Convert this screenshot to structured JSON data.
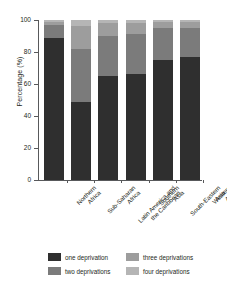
{
  "chart_data": {
    "type": "bar",
    "stacked": true,
    "title": "",
    "xlabel": "",
    "ylabel": "Percentage (%)",
    "ylim": [
      0,
      100
    ],
    "yticks": [
      0,
      20,
      40,
      60,
      80,
      100
    ],
    "grid": false,
    "legend_position": "bottom",
    "categories": [
      "Northern Africa",
      "Sub-Saharan Africa",
      "Latin America and the Caribbean",
      "Southern Asia",
      "South-Eastern Asia",
      "Western Asia"
    ],
    "category_lines": [
      [
        "Northern",
        "Africa"
      ],
      [
        "Sub-Saharan",
        "Africa"
      ],
      [
        "Latin America and",
        "the Caribbean"
      ],
      [
        "Southern",
        "Asia"
      ],
      [
        "South-Eastern",
        "Asia"
      ],
      [
        "Western",
        "Asia"
      ]
    ],
    "series": [
      {
        "name": "one deprivation",
        "color": "#2f2f2f",
        "values": [
          89,
          49,
          65,
          66,
          75,
          77
        ]
      },
      {
        "name": "two deprivations",
        "color": "#7b7b7b",
        "values": [
          8,
          33,
          25,
          25,
          20,
          18
        ]
      },
      {
        "name": "three deprivations",
        "color": "#9d9d9d",
        "values": [
          2,
          14,
          8,
          7,
          4,
          4
        ]
      },
      {
        "name": "four deprivations",
        "color": "#b5b5b5",
        "values": [
          1,
          4,
          2,
          2,
          1,
          1
        ]
      }
    ]
  },
  "legend": {
    "items": [
      {
        "label": "one deprivation",
        "color": "#2f2f2f"
      },
      {
        "label": "three deprivations",
        "color": "#9d9d9d"
      },
      {
        "label": "two deprivations",
        "color": "#7b7b7b"
      },
      {
        "label": "four deprivations",
        "color": "#b5b5b5"
      }
    ]
  },
  "axis_colors": {
    "axis_line": "#58595b",
    "text": "#231f20",
    "background": "#ffffff"
  }
}
